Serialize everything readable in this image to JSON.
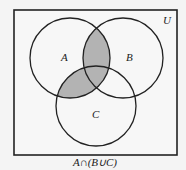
{
  "diagram": {
    "type": "venn",
    "universe_label": "U",
    "sets": [
      {
        "label": "A",
        "cx": 70,
        "cy": 58,
        "r": 40
      },
      {
        "label": "B",
        "cx": 123,
        "cy": 58,
        "r": 40
      },
      {
        "label": "C",
        "cx": 96,
        "cy": 106,
        "r": 40
      }
    ],
    "shaded_expression": "A ∩ (B ∪ C)",
    "caption": "A∩(B∪C)",
    "colors": {
      "shade": "#b3b3b3",
      "stroke": "#222222",
      "background": "#f4f4f4"
    }
  }
}
